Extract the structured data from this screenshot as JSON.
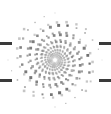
{
  "canvas": {
    "width": 111,
    "height": 114,
    "background_color": "#ffffff",
    "title": "Spiral halftone logo"
  },
  "artwork": {
    "name": "dotted-spiral-logo",
    "type": "halftone-logarithmic-spiral",
    "description": "Grayscale square-dot halftone forming a multi-arm logarithmic spiral",
    "center_x": 55,
    "center_y": 60,
    "arm_count": 4,
    "points_per_arm": 64,
    "turns": 2.45,
    "inner_radius": 2.0,
    "outer_radius": 47.0,
    "growth": 1.0,
    "min_dot": 0.6,
    "max_dot": 3.3,
    "dot_shape": "square",
    "dot_color_dark": "#4a4a4a",
    "dot_color_mid": "#8c8c8c",
    "dot_color_light": "#c8c8c8",
    "min_opacity": 0.18,
    "max_opacity": 0.92,
    "rotation_offset_deg": 18
  },
  "edge_marks": {
    "color": "#3a3a3a",
    "items": [
      {
        "name": "dash-left-upper",
        "x": 0,
        "y": 42,
        "width": 12,
        "height": 3
      },
      {
        "name": "dash-left-lower",
        "x": 0,
        "y": 79,
        "width": 12,
        "height": 3
      },
      {
        "name": "dash-right-upper",
        "x": 99,
        "y": 42,
        "width": 12,
        "height": 3
      },
      {
        "name": "dash-right-lower",
        "x": 99,
        "y": 79,
        "width": 12,
        "height": 3
      }
    ]
  }
}
